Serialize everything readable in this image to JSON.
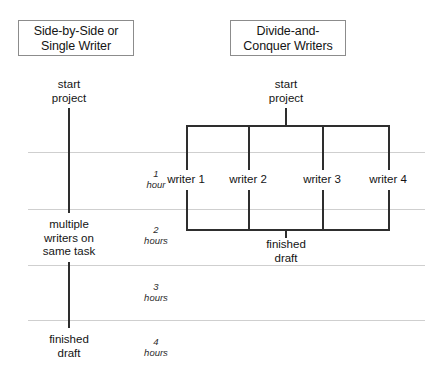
{
  "diagram": {
    "title_left": {
      "line1": "Side-by-Side or",
      "line2": "Single Writer"
    },
    "title_right": {
      "line1": "Divide-and-",
      "line2": "Conquer Writers"
    },
    "left_column": {
      "start": {
        "line1": "start",
        "line2": "project"
      },
      "middle": {
        "line1": "multiple",
        "line2": "writers on",
        "line3": "same task"
      },
      "end": {
        "line1": "finished",
        "line2": "draft"
      }
    },
    "right_column": {
      "start": {
        "line1": "start",
        "line2": "project"
      },
      "writers": [
        "writer 1",
        "writer 2",
        "writer 3",
        "writer 4"
      ],
      "end": {
        "line1": "finished",
        "line2": "draft"
      }
    },
    "time_axis": [
      {
        "number": "1",
        "unit": "hour"
      },
      {
        "number": "2",
        "unit": "hours"
      },
      {
        "number": "3",
        "unit": "hours"
      },
      {
        "number": "4",
        "unit": "hours"
      }
    ],
    "colors": {
      "line": "#2e2e2e",
      "gridline": "#cfcfcf",
      "box_border": "#8c8c8c",
      "text": "#141414",
      "background": "#ffffff"
    }
  }
}
